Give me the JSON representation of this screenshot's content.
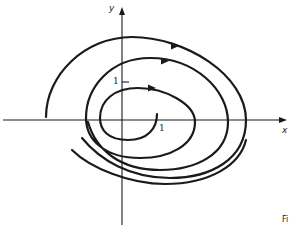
{
  "figure": {
    "type": "phase-portrait-spiral",
    "axes": {
      "x_label": "x",
      "y_label": "y",
      "x_tick_label": "1",
      "y_tick_label": "1"
    },
    "corner_text": "Fi",
    "colors": {
      "stroke": "#1a1a1a",
      "background": "#ffffff"
    }
  }
}
